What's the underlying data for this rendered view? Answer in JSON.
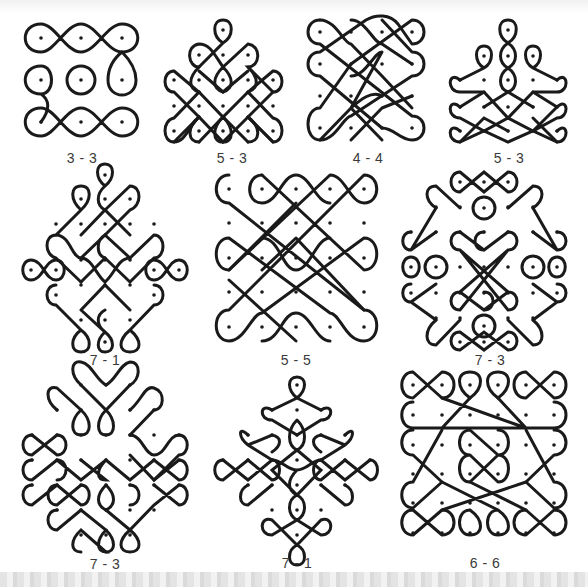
{
  "figure": {
    "stroke_color": "#1a1a1a",
    "background": "#ffffff",
    "patterns": [
      {
        "id": "p1",
        "label": "3 - 3",
        "label_pos": [
          82,
          150
        ],
        "row": 1,
        "col": 1
      },
      {
        "id": "p2",
        "label": "5 - 3",
        "label_pos": [
          232,
          150
        ],
        "row": 1,
        "col": 2
      },
      {
        "id": "p3",
        "label": "4 - 4",
        "label_pos": [
          368,
          150
        ],
        "row": 1,
        "col": 3
      },
      {
        "id": "p4",
        "label": "5 - 3",
        "label_pos": [
          509,
          150
        ],
        "row": 1,
        "col": 4
      },
      {
        "id": "p5",
        "label": "7 - 1",
        "label_pos": [
          105,
          352
        ],
        "row": 2,
        "col": 1
      },
      {
        "id": "p6",
        "label": "5 - 5",
        "label_pos": [
          296,
          352
        ],
        "row": 2,
        "col": 2
      },
      {
        "id": "p7",
        "label": "7 - 3",
        "label_pos": [
          490,
          352
        ],
        "row": 2,
        "col": 3
      },
      {
        "id": "p8",
        "label": "7 - 3",
        "label_pos": [
          105,
          558
        ],
        "row": 3,
        "col": 1
      },
      {
        "id": "p9",
        "label": "7 - 1",
        "label_pos": [
          297,
          555
        ],
        "row": 3,
        "col": 2
      },
      {
        "id": "p10",
        "label": "6 - 6",
        "label_pos": [
          485,
          555
        ],
        "row": 3,
        "col": 3
      }
    ]
  }
}
